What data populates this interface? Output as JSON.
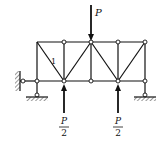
{
  "diagram": {
    "type": "truss",
    "labels": {
      "top_load": "P",
      "left_reaction_num": "P",
      "left_reaction_den": "2",
      "right_reaction_num": "P",
      "right_reaction_den": "2",
      "member_label": "1"
    },
    "colors": {
      "line": "#111111",
      "node_fill": "#ffffff",
      "hatch": "#333333"
    }
  }
}
